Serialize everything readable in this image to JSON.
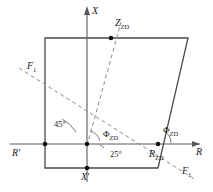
{
  "figure": {
    "type": "technical-geometry-diagram",
    "background_color": "#ffffff",
    "line_color": "#4a4a4a",
    "dash_color": "#8d8d8d",
    "axis_color": "#5a5a5a"
  },
  "axes": {
    "vertical": {
      "name": "X",
      "label_top": "X",
      "label_bottom": "X",
      "bottom_prime": "′"
    },
    "horizontal": {
      "name": "R",
      "label_right": "R",
      "label_left": "R",
      "left_prime": "′"
    }
  },
  "labels": {
    "z_zd": "Z",
    "z_zd_sub": "ZD",
    "phi_left": "Φ",
    "phi_left_sub": "ZD",
    "phi_right": "Φ",
    "phi_right_sub": "ZD",
    "r_zd": "R",
    "r_zd_sub": "ZD",
    "f1_upper": "F",
    "f1_upper_sub": "1",
    "f1_lower": "F",
    "f1_lower_sub": "1",
    "angle_45": "45°",
    "angle_25": "25°",
    "r_prime": "R",
    "r_prime_mark": "′",
    "x_prime": "X",
    "x_prime_mark": "′",
    "x_top": "X",
    "r_right": "R"
  },
  "geometry": {
    "origin": {
      "x": 87,
      "y": 144
    },
    "polygon_vertices": [
      {
        "name": "top-left",
        "x": 45,
        "y": 38
      },
      {
        "name": "top-right",
        "x": 188,
        "y": 38
      },
      {
        "name": "bottom-right",
        "x": 158,
        "y": 168
      },
      {
        "name": "bottom-left",
        "x": 45,
        "y": 168
      }
    ],
    "nodes": [
      {
        "name": "origin-node",
        "x": 87,
        "y": 144
      },
      {
        "name": "r-prime-node",
        "x": 45,
        "y": 144
      },
      {
        "name": "r-zd-node",
        "x": 158,
        "y": 144
      },
      {
        "name": "x-prime-node",
        "x": 87,
        "y": 168
      },
      {
        "name": "z-zd-node",
        "x": 111,
        "y": 38
      }
    ],
    "angles": {
      "phi_zd_degrees": 25,
      "forty_five_degrees": 45,
      "twenty_five_degrees": 25
    }
  }
}
